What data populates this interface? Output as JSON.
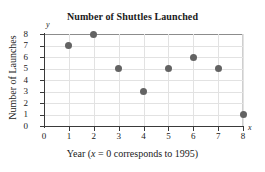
{
  "chart_data": {
    "type": "scatter",
    "title": "Number of Shuttles Launched",
    "xlabel": "Year (x = 0 corresponds to 1995)",
    "ylabel": "Number of Launches",
    "x": [
      1,
      2,
      3,
      4,
      5,
      6,
      7,
      8
    ],
    "values": [
      7,
      8,
      5,
      3,
      5,
      6,
      5,
      1
    ],
    "points": [
      {
        "x": 1,
        "y": 7
      },
      {
        "x": 2,
        "y": 8
      },
      {
        "x": 3,
        "y": 5
      },
      {
        "x": 4,
        "y": 3
      },
      {
        "x": 5,
        "y": 5
      },
      {
        "x": 6,
        "y": 6
      },
      {
        "x": 7,
        "y": 5
      },
      {
        "x": 8,
        "y": 1
      }
    ],
    "xlim": [
      0,
      8
    ],
    "ylim": [
      0,
      8
    ],
    "xticks": [
      "0",
      "1",
      "2",
      "3",
      "4",
      "5",
      "6",
      "7",
      "8"
    ],
    "yticks": [
      "0",
      "1",
      "2",
      "3",
      "4",
      "5",
      "6",
      "7",
      "8"
    ],
    "grid": true,
    "legend": null,
    "x_axis_letter": "x",
    "y_axis_letter": "y",
    "caption_prefix": "Year (",
    "caption_var": "x",
    "caption_suffix": " = 0 corresponds to 1995)",
    "marker_color": "#636363",
    "gridline_color": "#e2e2e2",
    "axis_color": "#3a3a3a",
    "text_color": "#1a1a1a",
    "background": "#ffffff"
  }
}
